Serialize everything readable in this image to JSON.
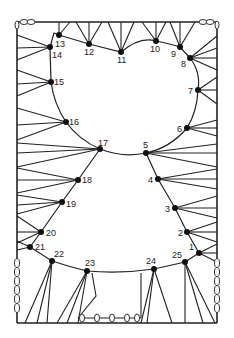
{
  "diagram": {
    "frame": {
      "left": 17,
      "right": 217,
      "top": 22,
      "bottom": 323
    },
    "nodes": [
      {
        "id": "1",
        "x": 199,
        "y": 253,
        "lx": 189,
        "ly": 250
      },
      {
        "id": "2",
        "x": 187,
        "y": 232,
        "lx": 178,
        "ly": 236
      },
      {
        "id": "3",
        "x": 175,
        "y": 208,
        "lx": 165,
        "ly": 212
      },
      {
        "id": "4",
        "x": 158,
        "y": 179,
        "lx": 148,
        "ly": 183
      },
      {
        "id": "5",
        "x": 146,
        "y": 153,
        "lx": 143,
        "ly": 148
      },
      {
        "id": "6",
        "x": 187,
        "y": 128,
        "lx": 177,
        "ly": 132
      },
      {
        "id": "7",
        "x": 198,
        "y": 90,
        "lx": 188,
        "ly": 94
      },
      {
        "id": "8",
        "x": 190,
        "y": 58,
        "lx": 181,
        "ly": 67
      },
      {
        "id": "9",
        "x": 180,
        "y": 47,
        "lx": 171,
        "ly": 57
      },
      {
        "id": "10",
        "x": 156,
        "y": 41,
        "lx": 150,
        "ly": 52
      },
      {
        "id": "11",
        "x": 121,
        "y": 52,
        "lx": 117,
        "ly": 63
      },
      {
        "id": "12",
        "x": 89,
        "y": 44,
        "lx": 84,
        "ly": 55
      },
      {
        "id": "13",
        "x": 59,
        "y": 35,
        "lx": 55,
        "ly": 47
      },
      {
        "id": "14",
        "x": 50,
        "y": 47,
        "lx": 52,
        "ly": 58
      },
      {
        "id": "15",
        "x": 51,
        "y": 82,
        "lx": 54,
        "ly": 85
      },
      {
        "id": "16",
        "x": 66,
        "y": 122,
        "lx": 69,
        "ly": 125
      },
      {
        "id": "17",
        "x": 100,
        "y": 149,
        "lx": 98,
        "ly": 146
      },
      {
        "id": "18",
        "x": 78,
        "y": 180,
        "lx": 82,
        "ly": 183
      },
      {
        "id": "19",
        "x": 62,
        "y": 202,
        "lx": 66,
        "ly": 207
      },
      {
        "id": "20",
        "x": 41,
        "y": 232,
        "lx": 46,
        "ly": 236
      },
      {
        "id": "21",
        "x": 30,
        "y": 247,
        "lx": 35,
        "ly": 250
      },
      {
        "id": "22",
        "x": 52,
        "y": 261,
        "lx": 54,
        "ly": 257
      },
      {
        "id": "23",
        "x": 87,
        "y": 271,
        "lx": 85,
        "ly": 266
      },
      {
        "id": "24",
        "x": 154,
        "y": 269,
        "lx": 146,
        "ly": 264
      },
      {
        "id": "25",
        "x": 185,
        "y": 262,
        "lx": 172,
        "ly": 258
      }
    ],
    "springs": {
      "top_left": [
        [
          25,
          22
        ],
        [
          33,
          22
        ]
      ],
      "top_right": [
        [
          201,
          22
        ],
        [
          209,
          22
        ]
      ],
      "left_side_x": 17,
      "left_side_y": [
        263,
        272,
        281,
        290,
        299,
        308
      ],
      "right_side_x": 217,
      "right_side_y": [
        263,
        272,
        281,
        290,
        299,
        308
      ],
      "bottom_y": 318,
      "bottom_x": [
        82,
        97,
        112,
        127,
        137
      ]
    }
  }
}
